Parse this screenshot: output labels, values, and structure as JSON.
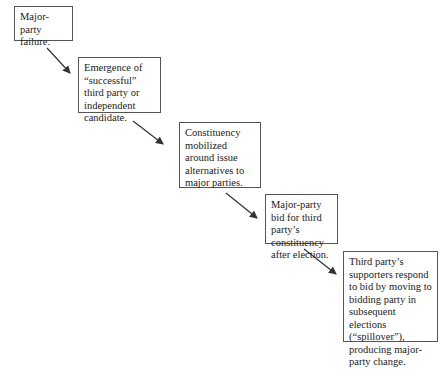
{
  "diagram": {
    "steps": [
      {
        "id": 1,
        "text": "Major-party failure."
      },
      {
        "id": 2,
        "text": "Emergence of “successful” third party or independent candidate."
      },
      {
        "id": 3,
        "text": "Constituency mobilized around issue alternatives to major parties."
      },
      {
        "id": 4,
        "text": "Major-party bid for third party’s constituency after election."
      },
      {
        "id": 5,
        "text": "Third party’s supporters respond to bid by moving to bidding party in subsequent elections (“spillover”), producing major-party change."
      }
    ],
    "arrows": [
      {
        "from": 1,
        "to": 2
      },
      {
        "from": 2,
        "to": 3
      },
      {
        "from": 3,
        "to": 4
      },
      {
        "from": 4,
        "to": 5
      }
    ],
    "colors": {
      "border": "#555555",
      "arrow": "#333333",
      "text": "#222222",
      "background": "#ffffff"
    }
  }
}
